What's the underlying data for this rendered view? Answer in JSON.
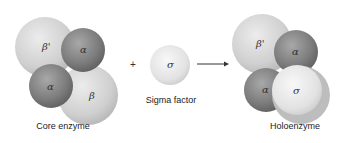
{
  "core_enzyme": {
    "label": "Core enzyme",
    "subunits": [
      {
        "name": "beta-prime",
        "symbol": "β'"
      },
      {
        "name": "alpha",
        "symbol": "α"
      },
      {
        "name": "alpha",
        "symbol": "α"
      },
      {
        "name": "beta",
        "symbol": "β"
      }
    ]
  },
  "operator_plus": "+",
  "sigma_factor": {
    "label": "Sigma factor",
    "symbol": "σ"
  },
  "holoenzyme": {
    "label": "Holoenzyme",
    "subunits": [
      {
        "name": "beta-prime",
        "symbol": "β'"
      },
      {
        "name": "alpha",
        "symbol": "α"
      },
      {
        "name": "alpha",
        "symbol": "α"
      },
      {
        "name": "sigma",
        "symbol": "σ"
      }
    ]
  },
  "colors": {
    "light_sphere": "#d0d0d0",
    "dark_sphere": "#7a7a7a",
    "sigma_sphere": "#e6e6e6"
  }
}
